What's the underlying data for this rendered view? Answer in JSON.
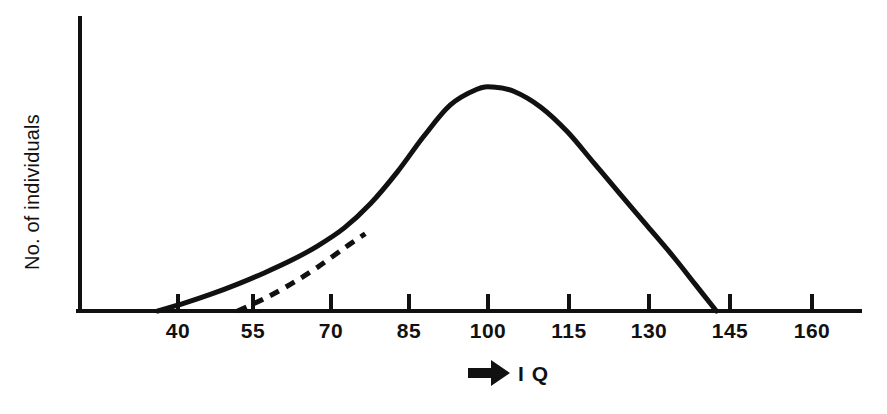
{
  "figure": {
    "background_color": "#ffffff",
    "ink_color": "#111111",
    "width": 887,
    "height": 414
  },
  "axes": {
    "y_axis": {
      "title": "No. of individuals",
      "x_px": 78,
      "top_px": 18,
      "bottom_px": 311,
      "show_ticks": false,
      "show_tick_labels": false
    },
    "x_axis": {
      "title": "I Q",
      "arrow_icon": "right-arrow-icon",
      "y_px": 311,
      "left_px": 78,
      "right_px": 860,
      "tick_length_px": 17,
      "tick_direction": "up"
    }
  },
  "chart_data": {
    "type": "line",
    "title": "",
    "subtitle": "",
    "xlabel": "I Q",
    "ylabel": "No. of individuals",
    "grid": false,
    "legend": "none",
    "xlim": [
      25,
      172
    ],
    "ylim": [
      0,
      1.05
    ],
    "x_ticks": [
      40,
      55,
      70,
      85,
      100,
      115,
      130,
      145,
      160
    ],
    "x_tick_labels": [
      "40",
      "55",
      "70",
      "85",
      "100",
      "115",
      "130",
      "145",
      "160"
    ],
    "y_ticks": [],
    "y_tick_labels": [],
    "series": [
      {
        "name": "observed-iq-distribution",
        "style": "solid",
        "stroke_width": 5,
        "color": "#111111",
        "x": [
          40,
          45,
          50,
          55,
          60,
          65,
          70,
          75,
          80,
          85,
          90,
          95,
          100,
          103,
          107,
          112,
          117,
          122,
          127,
          132,
          137,
          141,
          145
        ],
        "y": [
          0.0,
          0.035,
          0.075,
          0.12,
          0.17,
          0.225,
          0.29,
          0.37,
          0.48,
          0.62,
          0.78,
          0.92,
          0.99,
          1.0,
          0.98,
          0.91,
          0.8,
          0.66,
          0.52,
          0.38,
          0.24,
          0.12,
          0.0
        ]
      },
      {
        "name": "normal-curve-extrapolation",
        "style": "dashed",
        "stroke_width": 5,
        "dash_pattern": "10 8",
        "color": "#111111",
        "x": [
          55,
          60,
          65,
          70,
          75,
          79
        ],
        "y": [
          0.0,
          0.055,
          0.12,
          0.195,
          0.28,
          0.345
        ]
      }
    ],
    "annotations": [
      {
        "name": "excess-low-iq-region",
        "description": "Solid curve lies above the dashed normal extrapolation between IQ 40 and IQ 79"
      }
    ]
  },
  "x_tick_labels_layout": [
    {
      "label": "40",
      "x_px": 178
    },
    {
      "label": "55",
      "x_px": 253
    },
    {
      "label": "70",
      "x_px": 331
    },
    {
      "label": "85",
      "x_px": 409
    },
    {
      "label": "100",
      "x_px": 488
    },
    {
      "label": "115",
      "x_px": 569
    },
    {
      "label": "130",
      "x_px": 649
    },
    {
      "label": "145",
      "x_px": 730
    },
    {
      "label": "160",
      "x_px": 812
    }
  ]
}
